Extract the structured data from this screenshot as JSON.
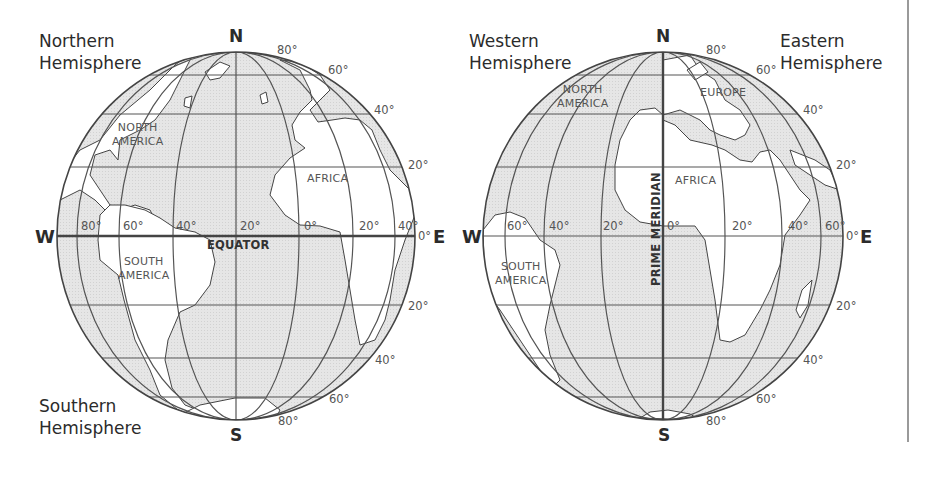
{
  "figure": {
    "left_globe": {
      "labels": {
        "top_left": [
          "Northern",
          "Hemisphere"
        ],
        "bottom_left": [
          "Southern",
          "Hemisphere"
        ],
        "north": "N",
        "south": "S",
        "west": "W",
        "east": "E",
        "equator": "EQUATOR",
        "east_zero": "0°"
      },
      "continents": {
        "north_america": [
          "NORTH",
          "AMERICA"
        ],
        "south_america": [
          "SOUTH",
          "AMERICA"
        ],
        "africa": "AFRICA"
      },
      "longitude_labels": [
        "80°",
        "60°",
        "40°",
        "20°",
        "0°",
        "20°",
        "40°"
      ],
      "latitude_labels_north": [
        "80°",
        "60°",
        "40°",
        "20°"
      ],
      "latitude_labels_south": [
        "20°",
        "40°",
        "60°",
        "80°"
      ]
    },
    "right_globe": {
      "labels": {
        "top_left": [
          "Western",
          "Hemisphere"
        ],
        "top_right": [
          "Eastern",
          "Hemisphere"
        ],
        "north": "N",
        "south": "S",
        "west": "W",
        "east": "E",
        "prime_meridian": "PRIME MERIDIAN",
        "east_zero": "0°"
      },
      "continents": {
        "north_america": [
          "NORTH",
          "AMERICA"
        ],
        "south_america": [
          "SOUTH",
          "AMERICA"
        ],
        "europe": "EUROPE",
        "africa": "AFRICA"
      },
      "longitude_labels": [
        "60°",
        "40°",
        "20°",
        "0°",
        "20°",
        "40°",
        "60°"
      ],
      "latitude_labels_north": [
        "80°",
        "60°",
        "40°",
        "20°"
      ],
      "latitude_labels_south": [
        "20°",
        "40°",
        "60°",
        "80°"
      ]
    },
    "colors": {
      "ocean_shade": "#e4e4e4",
      "land": "#ffffff",
      "grid_line": "#555555",
      "outline": "#444444",
      "text": "#2b2b2b"
    }
  }
}
